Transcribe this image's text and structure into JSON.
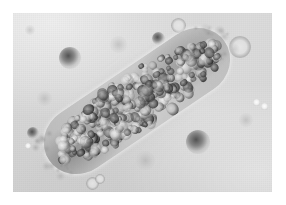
{
  "figure": {
    "modality": "light microscopy",
    "specimen_label": "cell cluster / cast",
    "alt_text": "A dense, elongated, diagonally oriented clump of tightly packed round cells on a pale gray background, surrounded by scattered small round debris particles."
  },
  "frame": {
    "paper_color": "#ffffff",
    "margin_px": 13,
    "field_width_px": 259,
    "field_height_px": 179
  },
  "background": {
    "base_color": "#d9d9d9",
    "light_color": "#dedede",
    "shadow_color": "#cfcfcf",
    "description": "evenly illuminated pale gray slide field with gentle vignetting"
  },
  "cell_cluster": {
    "name": "cell-cluster",
    "orientation_degrees": -34,
    "left_px": 18,
    "top_px": 55,
    "length_px": 212,
    "thickness_px": 66,
    "core_color": "#4a4a4a",
    "matrix_color": "#ececec",
    "description": "elongated aggregate of several dozen tightly packed round cells with dark refractile borders and pale centers"
  },
  "debris": [
    {
      "name": "granule-upper-left",
      "kind": "granule",
      "x": 70,
      "y": 58,
      "size": 22
    },
    {
      "name": "granule-mid-right",
      "kind": "granule",
      "x": 198,
      "y": 142,
      "size": 24
    },
    {
      "name": "granule-left-edge",
      "kind": "granule",
      "x": 33,
      "y": 133,
      "size": 12
    },
    {
      "name": "granule-top-center",
      "kind": "granule",
      "x": 158,
      "y": 38,
      "size": 13
    },
    {
      "name": "ring-cell-top-center",
      "kind": "ring",
      "x": 178,
      "y": 25,
      "size": 15
    },
    {
      "name": "ring-cell-top-right",
      "kind": "ring",
      "x": 240,
      "y": 47,
      "size": 22
    },
    {
      "name": "ring-cell-bottom-left",
      "kind": "ring",
      "x": 92,
      "y": 183,
      "size": 13
    },
    {
      "name": "ring-cell-bottom-left-b",
      "kind": "ring",
      "x": 100,
      "y": 179,
      "size": 10
    },
    {
      "name": "speck-right-upper",
      "kind": "speck",
      "x": 256,
      "y": 102,
      "size": 7
    },
    {
      "name": "speck-right-lower",
      "kind": "speck",
      "x": 264,
      "y": 106,
      "size": 7
    },
    {
      "name": "speck-left-lower",
      "kind": "speck",
      "x": 28,
      "y": 146,
      "size": 6
    },
    {
      "name": "smudge-upper-mid",
      "kind": "smudge",
      "x": 118,
      "y": 44,
      "size": 17
    },
    {
      "name": "smudge-lower-center",
      "kind": "smudge",
      "x": 145,
      "y": 160,
      "size": 19
    },
    {
      "name": "smudge-left-mid",
      "kind": "smudge",
      "x": 44,
      "y": 98,
      "size": 15
    },
    {
      "name": "smudge-right-mid",
      "kind": "smudge",
      "x": 246,
      "y": 120,
      "size": 14
    },
    {
      "name": "smudge-top-left",
      "kind": "smudge",
      "x": 30,
      "y": 30,
      "size": 10
    }
  ]
}
